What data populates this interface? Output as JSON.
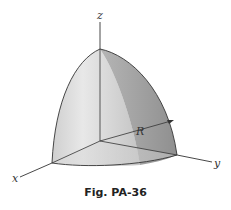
{
  "figure": {
    "caption": "Fig. PA-36",
    "axes": {
      "x_label": "x",
      "y_label": "y",
      "z_label": "z"
    },
    "dimension_label": "R",
    "colors": {
      "outline": "#333333",
      "face_left_light": "#e6e6e6",
      "face_left_dark": "#bdbdbd",
      "face_right": "#9e9e9e",
      "face_bottom": "#d2d2d2"
    }
  }
}
